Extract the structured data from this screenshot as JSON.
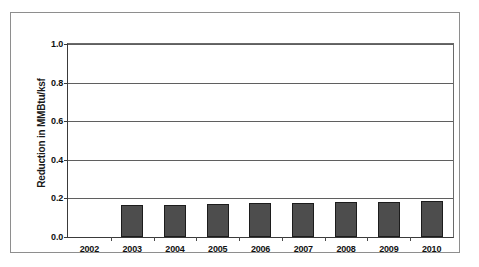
{
  "chart_data": {
    "type": "bar",
    "title": "",
    "xlabel": "",
    "ylabel": "Reduction in MMBtu/ksf",
    "categories": [
      "2002",
      "2003",
      "2004",
      "2005",
      "2006",
      "2007",
      "2008",
      "2009",
      "2010"
    ],
    "values": [
      0.0,
      0.165,
      0.168,
      0.171,
      0.175,
      0.177,
      0.18,
      0.183,
      0.187
    ],
    "ylim": [
      0.0,
      1.0
    ],
    "y_ticks": [
      "0.0",
      "0.2",
      "0.4",
      "0.6",
      "0.8",
      "1.0"
    ],
    "y_tick_values": [
      0.0,
      0.2,
      0.4,
      0.6,
      0.8,
      1.0
    ],
    "grid": true,
    "legend": "none",
    "bar_color": "#4d4d4d",
    "bar_border_color": "#1c1c1c",
    "gridline_color": "#5f5f5f",
    "axis_color": "#3a3a3a",
    "frame_color": "#8e8e8e",
    "background": "#ffffff"
  }
}
